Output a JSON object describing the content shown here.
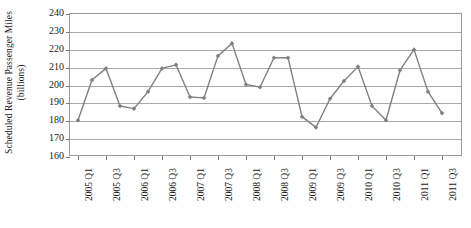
{
  "chart_data": {
    "type": "line",
    "title": "",
    "xlabel": "",
    "ylabel": "Scheduled Revenue Passenger Miles (billions)",
    "ylabel_line1": "Scheduled Revenue Passenger Miles",
    "ylabel_line2": "(billions)",
    "ylim": [
      160,
      240
    ],
    "ytick_step": 10,
    "yticks": [
      160,
      170,
      180,
      190,
      200,
      210,
      220,
      230,
      240
    ],
    "ytick_labels": [
      "160",
      "170",
      "180",
      "190",
      "200",
      "210",
      "220",
      "230",
      "240"
    ],
    "grid": true,
    "grid_axis": "y",
    "legend": false,
    "legend_position": "none",
    "marker": "diamond",
    "line_color": "#808080",
    "marker_color": "#808080",
    "x": [
      "2005 Q1",
      "2005 Q2",
      "2005 Q3",
      "2005 Q4",
      "2006 Q1",
      "2006 Q2",
      "2006 Q3",
      "2006 Q4",
      "2007 Q1",
      "2007 Q2",
      "2007 Q3",
      "2007 Q4",
      "2008 Q1",
      "2008 Q2",
      "2008 Q3",
      "2008 Q4",
      "2009 Q1",
      "2009 Q2",
      "2009 Q3",
      "2009 Q4",
      "2010 Q1",
      "2010 Q2",
      "2010 Q3",
      "2010 Q4",
      "2011 Q1",
      "2011 Q2",
      "2011 Q3"
    ],
    "values": [
      180.0,
      202.5,
      209.0,
      188.0,
      186.5,
      196.0,
      209.0,
      211.0,
      193.0,
      192.5,
      216.0,
      223.0,
      200.0,
      198.5,
      215.0,
      215.0,
      182.0,
      176.0,
      192.0,
      202.0,
      210.0,
      188.0,
      180.0,
      208.0,
      219.5,
      196.0,
      184.0
    ],
    "xtick_labels_shown": [
      "2005 Q1",
      "2005 Q3",
      "2006 Q1",
      "2006 Q3",
      "2007 Q1",
      "2007 Q3",
      "2008 Q1",
      "2008 Q3",
      "2009 Q1",
      "2009 Q3",
      "2010 Q1",
      "2010 Q3",
      "2011 Q1",
      "2011 Q3"
    ],
    "xtick_label_indices": [
      0,
      2,
      4,
      6,
      8,
      10,
      12,
      14,
      16,
      18,
      20,
      22,
      24,
      26
    ]
  }
}
